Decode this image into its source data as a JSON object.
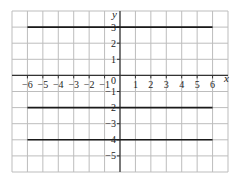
{
  "chart_data": {
    "type": "line",
    "title": "",
    "xlabel": "x",
    "ylabel": "y",
    "xlim": [
      -7,
      7
    ],
    "ylim": [
      -6,
      4
    ],
    "grid": true,
    "x_ticks": [
      -6,
      -5,
      -4,
      -3,
      -2,
      -1,
      1,
      2,
      3,
      4,
      5,
      6
    ],
    "y_ticks": [
      3,
      2,
      1,
      -1,
      -2,
      -3,
      -4,
      -5
    ],
    "origin_label": "0",
    "series": [
      {
        "name": "y = 3",
        "x": [
          -6,
          6
        ],
        "y": [
          3,
          3
        ]
      },
      {
        "name": "y = -2",
        "x": [
          -6,
          6
        ],
        "y": [
          -2,
          -2
        ]
      },
      {
        "name": "y = -4",
        "x": [
          -6,
          6
        ],
        "y": [
          -4,
          -4
        ]
      }
    ],
    "colors": {
      "grid": "#bdbdbd",
      "axis": "#333333",
      "line": "#1a1a1a"
    }
  }
}
